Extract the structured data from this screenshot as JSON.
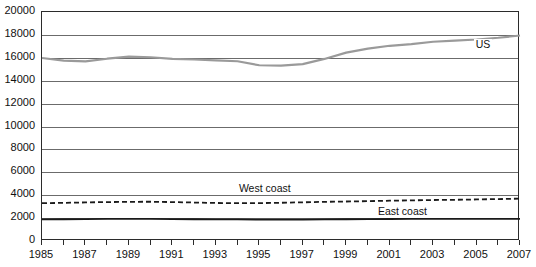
{
  "chart_data": {
    "type": "line",
    "title": "",
    "subtitle": "",
    "xlabel": "",
    "ylabel": "",
    "xlim": [
      1985,
      2007
    ],
    "ylim": [
      0,
      20000
    ],
    "grid": true,
    "legend_position": "inline-right-of-series",
    "x": [
      1985,
      1986,
      1987,
      1988,
      1989,
      1990,
      1991,
      1992,
      1993,
      1994,
      1995,
      1996,
      1997,
      1998,
      1999,
      2000,
      2001,
      2002,
      2003,
      2004,
      2005,
      2006,
      2007
    ],
    "y_ticks": [
      0,
      2000,
      4000,
      6000,
      8000,
      10000,
      12000,
      14000,
      16000,
      18000,
      20000
    ],
    "y_tick_labels": [
      "0",
      "2000",
      "4000",
      "6000",
      "8000",
      "10000",
      "12000",
      "14000",
      "16000",
      "18000",
      "20000"
    ],
    "x_ticks": [
      1985,
      1986,
      1987,
      1988,
      1989,
      1990,
      1991,
      1992,
      1993,
      1994,
      1995,
      1996,
      1997,
      1998,
      1999,
      2000,
      2001,
      2002,
      2003,
      2004,
      2005,
      2006,
      2007
    ],
    "x_tick_labels": [
      "1985",
      "",
      "1987",
      "",
      "1989",
      "",
      "1991",
      "",
      "1993",
      "",
      "1995",
      "",
      "1997",
      "",
      "1999",
      "",
      "2001",
      "",
      "2003",
      "",
      "2005",
      "",
      "2007"
    ],
    "x_visible_labels": [
      "1985",
      "1987",
      "1989",
      "1991",
      "1993",
      "1995",
      "1997",
      "1999",
      "2001",
      "2003",
      "2005",
      "2007"
    ],
    "series": [
      {
        "name": "US",
        "label": "US",
        "color": "#9a9a9a",
        "style": "solid",
        "width": 2.2,
        "label_x": 2005.1,
        "label_y": 17050,
        "values": [
          15980,
          15750,
          15680,
          15920,
          16100,
          16050,
          15900,
          15850,
          15780,
          15700,
          15350,
          15320,
          15450,
          15900,
          16450,
          16800,
          17050,
          17200,
          17400,
          17500,
          17600,
          17750,
          17950
        ]
      },
      {
        "name": "West coast",
        "label": "West coast",
        "color": "#1a1a1a",
        "style": "dashed",
        "width": 1.8,
        "label_x": 1994.2,
        "label_y": 4450,
        "values": [
          3300,
          3330,
          3370,
          3400,
          3420,
          3430,
          3400,
          3360,
          3320,
          3300,
          3310,
          3340,
          3380,
          3420,
          3450,
          3480,
          3520,
          3550,
          3580,
          3600,
          3630,
          3660,
          3700
        ]
      },
      {
        "name": "East coast",
        "label": "East coast",
        "color": "#1a1a1a",
        "style": "solid",
        "width": 1.8,
        "label_x": 2000.6,
        "label_y": 2480,
        "values": [
          1880,
          1900,
          1910,
          1930,
          1940,
          1930,
          1910,
          1900,
          1890,
          1880,
          1870,
          1860,
          1870,
          1880,
          1900,
          1910,
          1920,
          1930,
          1930,
          1930,
          1930,
          1930,
          1930
        ]
      }
    ]
  },
  "layout": {
    "plot": {
      "left": 41,
      "top": 11,
      "right": 519,
      "bottom": 240
    }
  }
}
